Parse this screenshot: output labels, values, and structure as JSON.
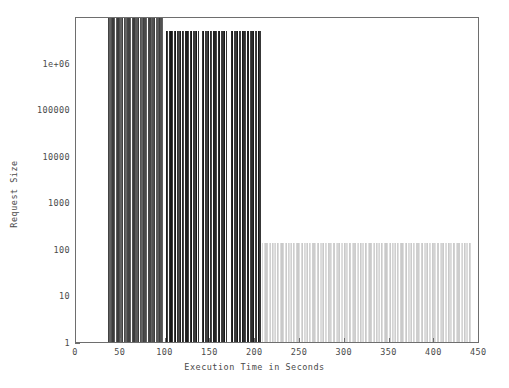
{
  "chart_data": {
    "type": "bar",
    "title": "",
    "xlabel": "Execution Time in Seconds",
    "ylabel": "Request Size",
    "xlim": [
      0,
      460
    ],
    "ylim": [
      1,
      4000000
    ],
    "yscale": "log",
    "grid": false,
    "legend": null,
    "xticks": [
      0,
      50,
      100,
      150,
      200,
      250,
      300,
      350,
      400,
      450
    ],
    "xtick_labels": [
      "0",
      "50",
      "100",
      "150",
      "200",
      "250",
      "300",
      "350",
      "400",
      "450"
    ],
    "yticks": [
      1,
      10,
      100,
      1000,
      10000,
      100000,
      1000000
    ],
    "ytick_labels": [
      "1",
      "10",
      "100",
      "1000",
      "100000",
      "100000",
      "1e+06"
    ],
    "ytick_labels_display": [
      "1",
      "10",
      "100",
      "1000",
      "10000",
      "100000",
      "1e+06"
    ],
    "series": [
      {
        "name": "requests",
        "description": "Dense impulse bars; request size plotted against execution time.",
        "blocks": [
          {
            "x_start": 36,
            "x_end": 99,
            "value": 4000000,
            "shade": "dark-gray"
          },
          {
            "x_start": 102,
            "x_end": 140,
            "value": 2000000,
            "shade": "near-black"
          },
          {
            "x_start": 143,
            "x_end": 172,
            "value": 2000000,
            "shade": "near-black"
          },
          {
            "x_start": 176,
            "x_end": 210,
            "value": 2000000,
            "shade": "near-black"
          },
          {
            "x_start": 212,
            "x_end": 450,
            "value": 100,
            "shade": "light-gray"
          }
        ]
      }
    ]
  },
  "colors": {
    "axis": "#6e6e6e",
    "text": "#4a4a4a",
    "background": "#ffffff",
    "bar_dark_gray": "#3c3c3c",
    "bar_near_black": "#171717",
    "bar_light_gray": "#c9c9c9"
  }
}
